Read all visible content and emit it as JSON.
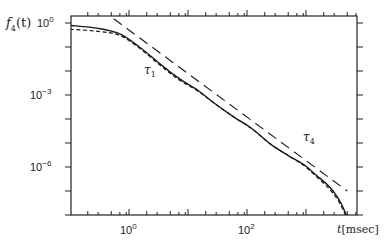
{
  "chart_data": {
    "type": "line",
    "title": "",
    "xlabel": "t[msec]",
    "ylabel": "f4(t)",
    "xscale": "log",
    "yscale": "log",
    "xlim": [
      0.1,
      7400
    ],
    "ylim": [
      1e-08,
      3
    ],
    "x_tick_labels": [
      "10^0",
      "10^2"
    ],
    "y_tick_labels": [
      "10^0",
      "10^-3",
      "10^-6"
    ],
    "grid": false,
    "annotations": [
      {
        "text": "τ1",
        "x": 3,
        "y": 0.01
      },
      {
        "text": "τ4",
        "x": 400,
        "y": 1e-05
      }
    ],
    "series": [
      {
        "name": "solid",
        "style": "solid",
        "x": [
          0.1,
          0.3,
          0.7,
          1.5,
          3,
          5,
          8,
          15,
          30,
          60,
          120,
          250,
          500,
          900,
          1500,
          2500,
          3500,
          4500,
          5500,
          6500
        ],
        "y": [
          0.8,
          0.6,
          0.35,
          0.1,
          0.025,
          0.009,
          0.004,
          0.0015,
          0.0004,
          0.00012,
          4e-05,
          9e-06,
          3e-06,
          1.3e-06,
          4.5e-07,
          1.5e-07,
          5e-08,
          1.5e-08,
          4e-09,
          1e-09
        ]
      },
      {
        "name": "dashed",
        "style": "dashed",
        "x": [
          0.1,
          0.3,
          0.7,
          1.5,
          3,
          5,
          8,
          15,
          30,
          60,
          120,
          250,
          500,
          900,
          1500,
          2500,
          3500,
          4500,
          5500,
          6300
        ],
        "y": [
          0.55,
          0.45,
          0.3,
          0.09,
          0.022,
          0.008,
          0.0035,
          0.0014,
          0.0004,
          0.00012,
          4e-05,
          9e-06,
          3e-06,
          1.2e-06,
          4e-07,
          1.2e-07,
          4e-08,
          1.2e-08,
          3e-09,
          1e-09
        ]
      },
      {
        "name": "long-dash asymptote",
        "style": "longdash",
        "x": [
          0.55,
          5000
        ],
        "y": [
          1.5,
          1e-07
        ]
      }
    ]
  },
  "labels": {
    "ylabel_main": "f",
    "ylabel_sub": "4",
    "ylabel_arg": "(t)",
    "xlabel_var": "t",
    "xlabel_unit": "[msec]",
    "xtick0_base": "10",
    "xtick0_exp": "0",
    "xtick2_base": "10",
    "xtick2_exp": "2",
    "ytick0_base": "10",
    "ytick0_exp": "0",
    "ytick3_base": "10",
    "ytick3_exp": "−3",
    "ytick6_base": "10",
    "ytick6_exp": "−6",
    "tau1_main": "τ",
    "tau1_sub": "1",
    "tau4_main": "τ",
    "tau4_sub": "4"
  }
}
